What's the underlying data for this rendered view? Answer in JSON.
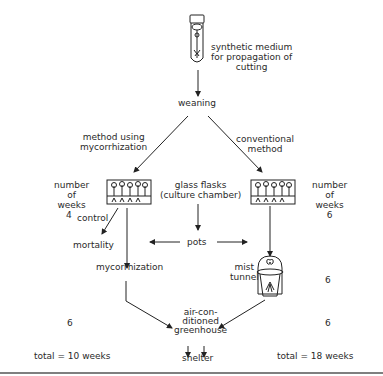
{
  "diagram": {
    "top": {
      "label_line1": "synthetic medium",
      "label_line2": "for propagation of",
      "label_line3": "cutting",
      "icon": "test-tube-with-cutting"
    },
    "weaning": "weaning",
    "left_branch": {
      "title_line1": "method using",
      "title_line2": "mycorrhization",
      "weeks_label_line1": "number",
      "weeks_label_line2": "of",
      "weeks_label_line3": "weeks",
      "weeks_value_1": "4",
      "control": "control",
      "mortality": "mortality",
      "mycorrhization": "mycorrhization",
      "weeks_value_2": "6",
      "total": "total = 10 weeks"
    },
    "center": {
      "flasks_line1": "glass flasks",
      "flasks_line2": "(culture chamber)",
      "pots": "pots"
    },
    "right_branch": {
      "title_line1": "conventional",
      "title_line2": "method",
      "weeks_label_line1": "number",
      "weeks_label_line2": "of",
      "weeks_label_line3": "weeks",
      "weeks_value_1": "6",
      "mist_line1": "mist",
      "mist_line2": "tunnel",
      "weeks_value_2": "6",
      "weeks_value_3": "6",
      "total": "total = 18 weeks"
    },
    "bottom": {
      "greenhouse_line1": "air-con-",
      "greenhouse_line2": "ditioned",
      "greenhouse_line3": "greenhouse",
      "shelter": "shelter"
    }
  }
}
